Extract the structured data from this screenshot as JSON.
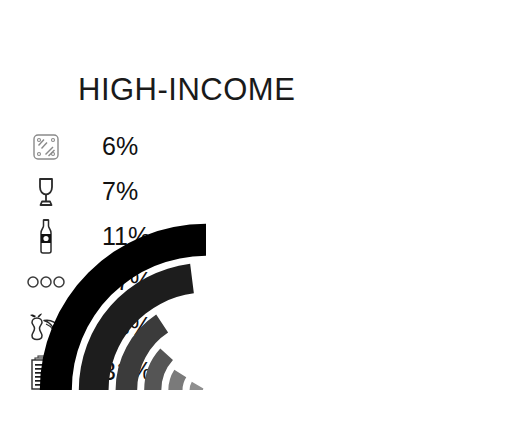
{
  "header": {
    "title": "HIGH-INCOME"
  },
  "chart_data": {
    "type": "pie",
    "title": "HIGH-INCOME",
    "subtitle": "",
    "xlabel": "",
    "ylabel": "",
    "unit": "%",
    "legend_position": "left",
    "grid": false,
    "categories": [
      "packaged-goods",
      "beverages-glass",
      "bottled-drinks",
      "eggs",
      "food-scraps",
      "paper"
    ],
    "values": [
      6,
      7,
      11,
      17,
      28,
      31
    ],
    "labels": [
      "6%",
      "7%",
      "11%",
      "17%",
      "28%",
      "31%"
    ],
    "colors": [
      "#8f8f8f",
      "#7a7a7a",
      "#555555",
      "#3b3b3b",
      "#1d1d1d",
      "#000000"
    ],
    "icons": [
      "packaged-tray-icon",
      "wine-glass-icon",
      "bottle-icon",
      "eggs-icon",
      "food-scraps-icon",
      "paper-stack-icon"
    ],
    "series": [
      {
        "name": "High-income waste composition",
        "values": [
          6,
          7,
          11,
          17,
          28,
          31
        ]
      }
    ]
  },
  "legend": {
    "rows": [
      {
        "icon": "packaged-tray-icon",
        "value": "6%"
      },
      {
        "icon": "wine-glass-icon",
        "value": "7%"
      },
      {
        "icon": "bottle-icon",
        "value": "11%"
      },
      {
        "icon": "eggs-icon",
        "value": "17%"
      },
      {
        "icon": "food-scraps-icon",
        "value": "28%"
      },
      {
        "icon": "paper-stack-icon",
        "value": "31%"
      }
    ]
  },
  "colors": {
    "background": "#ffffff",
    "text": "#111111",
    "darkest": "#000000",
    "lightest": "#8f8f8f"
  }
}
